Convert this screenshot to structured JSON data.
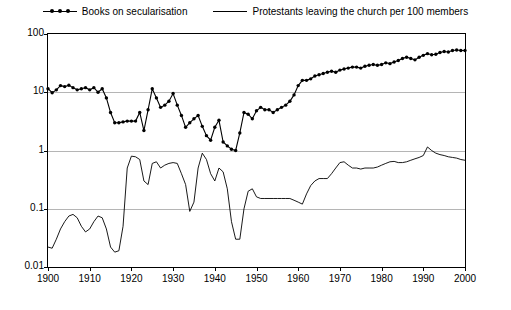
{
  "legend": {
    "items": [
      {
        "label": "Books on secularisation",
        "marker": "line-with-dots",
        "color": "#000000"
      },
      {
        "label": "Protestants leaving the church per 100 members",
        "marker": "line",
        "color": "#000000"
      }
    ]
  },
  "chart_data": {
    "type": "line",
    "title": "",
    "subtitle": "",
    "xlabel": "",
    "ylabel": "",
    "yscale": "log",
    "ylim": [
      0.01,
      100
    ],
    "ytick_labels": [
      "100",
      "10",
      "1",
      "0.1",
      "0.01"
    ],
    "ytick_values": [
      100,
      10,
      1,
      0.1,
      0.01
    ],
    "xlim": [
      1900,
      2000
    ],
    "xtick_labels": [
      "1900",
      "1910",
      "1920",
      "1930",
      "1940",
      "1950",
      "1960",
      "1970",
      "1980",
      "1990",
      "2000"
    ],
    "xtick_values": [
      1900,
      1910,
      1920,
      1930,
      1940,
      1950,
      1960,
      1970,
      1980,
      1990,
      2000
    ],
    "grid": true,
    "legend_position": "top-center",
    "series": [
      {
        "name": "Books on secularisation",
        "markers": true,
        "color": "#000000",
        "x": [
          1900,
          1901,
          1902,
          1903,
          1904,
          1905,
          1906,
          1907,
          1908,
          1909,
          1910,
          1911,
          1912,
          1913,
          1914,
          1915,
          1916,
          1917,
          1918,
          1919,
          1920,
          1921,
          1922,
          1923,
          1924,
          1925,
          1926,
          1927,
          1928,
          1929,
          1930,
          1931,
          1932,
          1933,
          1934,
          1935,
          1936,
          1937,
          1938,
          1939,
          1940,
          1941,
          1942,
          1943,
          1944,
          1945,
          1946,
          1947,
          1948,
          1949,
          1950,
          1951,
          1952,
          1953,
          1954,
          1955,
          1956,
          1957,
          1958,
          1959,
          1960,
          1961,
          1962,
          1963,
          1964,
          1965,
          1966,
          1967,
          1968,
          1969,
          1970,
          1971,
          1972,
          1973,
          1974,
          1975,
          1976,
          1977,
          1978,
          1979,
          1980,
          1981,
          1982,
          1983,
          1984,
          1985,
          1986,
          1987,
          1988,
          1989,
          1990,
          1991,
          1992,
          1993,
          1994,
          1995,
          1996,
          1997,
          1998,
          1999,
          2000
        ],
        "y": [
          11.5,
          9.8,
          11.0,
          13.0,
          12.5,
          13.2,
          12.0,
          11.0,
          11.5,
          12.0,
          11.0,
          12.0,
          10.0,
          11.5,
          8.0,
          4.5,
          3.0,
          3.0,
          3.1,
          3.2,
          3.2,
          3.2,
          4.5,
          2.2,
          5.0,
          11.5,
          8.0,
          5.5,
          6.0,
          7.0,
          9.5,
          6.0,
          4.0,
          2.5,
          3.0,
          3.5,
          4.0,
          2.6,
          1.8,
          1.5,
          2.5,
          3.3,
          1.4,
          1.2,
          1.05,
          1.0,
          2.0,
          4.5,
          4.2,
          3.5,
          4.8,
          5.5,
          5.0,
          5.0,
          4.5,
          5.0,
          5.5,
          6.0,
          7.0,
          9.0,
          13.0,
          16.0,
          16.0,
          17.0,
          19.0,
          20.0,
          21.0,
          22.0,
          23.0,
          22.0,
          24.0,
          25.0,
          26.0,
          27.0,
          27.0,
          26.0,
          28.0,
          29.0,
          30.0,
          29.0,
          30.0,
          32.0,
          31.0,
          33.0,
          35.0,
          38.0,
          40.0,
          38.0,
          36.0,
          40.0,
          43.0,
          46.0,
          44.0,
          45.0,
          48.0,
          50.0,
          49.0,
          52.0,
          53.0,
          52.0,
          52.0
        ]
      },
      {
        "name": "Protestants leaving the church per 100 members",
        "markers": false,
        "color": "#000000",
        "x": [
          1900,
          1901,
          1902,
          1903,
          1904,
          1905,
          1906,
          1907,
          1908,
          1909,
          1910,
          1911,
          1912,
          1913,
          1914,
          1915,
          1916,
          1917,
          1918,
          1919,
          1920,
          1921,
          1922,
          1923,
          1924,
          1925,
          1926,
          1927,
          1928,
          1929,
          1930,
          1931,
          1932,
          1933,
          1934,
          1935,
          1936,
          1937,
          1938,
          1939,
          1940,
          1941,
          1942,
          1943,
          1944,
          1945,
          1946,
          1947,
          1948,
          1949,
          1950,
          1951,
          1952,
          1953,
          1954,
          1955,
          1956,
          1957,
          1958,
          1959,
          1960,
          1961,
          1962,
          1963,
          1964,
          1965,
          1966,
          1967,
          1968,
          1969,
          1970,
          1971,
          1972,
          1973,
          1974,
          1975,
          1976,
          1977,
          1978,
          1979,
          1980,
          1981,
          1982,
          1983,
          1984,
          1985,
          1986,
          1987,
          1988,
          1989,
          1990,
          1991,
          1992,
          1993,
          1994,
          1995,
          1996,
          1997,
          1998,
          1999,
          2000
        ],
        "y": [
          0.022,
          0.021,
          0.03,
          0.045,
          0.06,
          0.075,
          0.08,
          0.07,
          0.05,
          0.04,
          0.045,
          0.06,
          0.075,
          0.07,
          0.045,
          0.022,
          0.018,
          0.019,
          0.05,
          0.5,
          0.8,
          0.78,
          0.7,
          0.3,
          0.26,
          0.6,
          0.64,
          0.5,
          0.56,
          0.6,
          0.62,
          0.6,
          0.4,
          0.26,
          0.09,
          0.13,
          0.5,
          0.9,
          0.7,
          0.4,
          0.3,
          0.5,
          0.43,
          0.22,
          0.06,
          0.03,
          0.03,
          0.1,
          0.2,
          0.22,
          0.16,
          0.15,
          0.15,
          0.15,
          0.15,
          0.15,
          0.15,
          0.15,
          0.15,
          0.14,
          0.13,
          0.12,
          0.18,
          0.25,
          0.3,
          0.33,
          0.33,
          0.33,
          0.4,
          0.5,
          0.62,
          0.64,
          0.56,
          0.5,
          0.5,
          0.48,
          0.5,
          0.5,
          0.5,
          0.52,
          0.56,
          0.6,
          0.64,
          0.65,
          0.62,
          0.62,
          0.64,
          0.68,
          0.72,
          0.76,
          0.82,
          1.15,
          1.0,
          0.9,
          0.85,
          0.82,
          0.78,
          0.76,
          0.74,
          0.7,
          0.68
        ]
      }
    ]
  }
}
